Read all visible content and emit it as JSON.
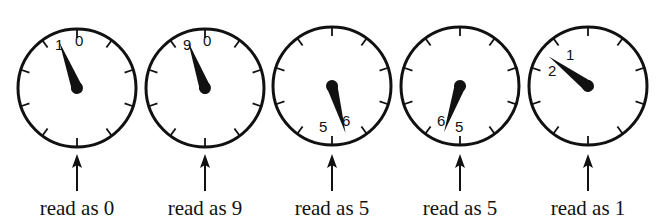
{
  "figure": {
    "stroke_color": "#111111",
    "background": "#ffffff"
  },
  "dials": [
    {
      "cx": 77,
      "cy": 88,
      "r": 59,
      "pointer_angle": -21,
      "labels": [
        {
          "text": "1",
          "x": -22,
          "y": -38
        },
        {
          "text": "0",
          "x": -2,
          "y": -42
        }
      ],
      "caption": "read as 0"
    },
    {
      "cx": 205,
      "cy": 88,
      "r": 59,
      "pointer_angle": -20,
      "labels": [
        {
          "text": "9",
          "x": -22,
          "y": -38
        },
        {
          "text": "0",
          "x": -2,
          "y": -42
        }
      ],
      "caption": "read as 9"
    },
    {
      "cx": 332,
      "cy": 86,
      "r": 59,
      "pointer_angle": 164,
      "labels": [
        {
          "text": "5",
          "x": -13,
          "y": 46
        },
        {
          "text": "6",
          "x": 10,
          "y": 40
        }
      ],
      "caption": "read as 5"
    },
    {
      "cx": 460,
      "cy": 86,
      "r": 59,
      "pointer_angle": 199,
      "labels": [
        {
          "text": "6",
          "x": -23,
          "y": 40
        },
        {
          "text": "5",
          "x": -5,
          "y": 46
        }
      ],
      "caption": "read as 5"
    },
    {
      "cx": 588,
      "cy": 86,
      "r": 59,
      "pointer_angle": -53,
      "labels": [
        {
          "text": "1",
          "x": -22,
          "y": -26
        },
        {
          "text": "2",
          "x": -40,
          "y": -10
        }
      ],
      "caption": "read as 1"
    }
  ]
}
